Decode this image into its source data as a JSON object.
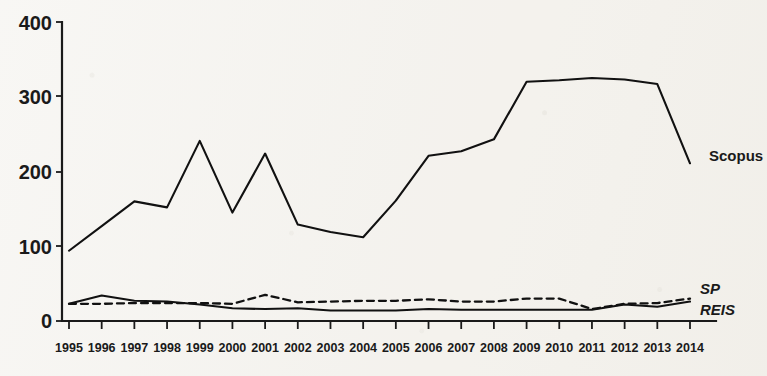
{
  "chart_data": {
    "type": "line",
    "title": "",
    "subtitle": "",
    "xlabel": "",
    "ylabel": "",
    "xlim": [
      1995,
      2014
    ],
    "ylim": [
      0,
      400
    ],
    "yticks": [
      0,
      100,
      200,
      300,
      400
    ],
    "ytick_labels": [
      "0",
      "100",
      "200",
      "300",
      "400"
    ],
    "grid": false,
    "legend_position": "right-inline",
    "categories": [
      1995,
      1996,
      1997,
      1998,
      1999,
      2000,
      2001,
      2002,
      2003,
      2004,
      2005,
      2006,
      2007,
      2008,
      2009,
      2010,
      2011,
      2012,
      2013,
      2014
    ],
    "xtick_labels": [
      "1995",
      "1996",
      "1997",
      "1998",
      "1999",
      "2000",
      "2001",
      "2002",
      "2003",
      "2004",
      "2005",
      "2006",
      "2007",
      "2008",
      "2009",
      "2010",
      "2011",
      "2012",
      "2013",
      "2014"
    ],
    "series": [
      {
        "name": "Scopus",
        "style": "solid",
        "label_italic": false,
        "color": "#111111",
        "values": [
          94,
          127,
          160,
          152,
          241,
          145,
          224,
          129,
          119,
          112,
          161,
          221,
          227,
          243,
          320,
          322,
          325,
          323,
          317,
          211
        ]
      },
      {
        "name": "SP",
        "style": "dashed",
        "label_italic": true,
        "color": "#111111",
        "values": [
          23,
          23,
          24,
          24,
          24,
          23,
          35,
          25,
          26,
          27,
          27,
          29,
          26,
          26,
          30,
          30,
          16,
          23,
          24,
          30
        ]
      },
      {
        "name": "REIS",
        "style": "solid",
        "label_italic": true,
        "color": "#111111",
        "values": [
          23,
          34,
          27,
          26,
          22,
          17,
          16,
          17,
          14,
          14,
          14,
          16,
          15,
          15,
          15,
          15,
          15,
          22,
          19,
          26
        ]
      }
    ],
    "annotations": [
      {
        "text": "Scopus",
        "x": 2014,
        "y": 213
      },
      {
        "text": "SP",
        "x": 2014,
        "y": 50
      },
      {
        "text": "REIS",
        "x": 2014,
        "y": 26
      }
    ]
  },
  "colors": {
    "background": "#f4f2ed",
    "ink": "#111111",
    "axis": "#1a1a1a"
  }
}
